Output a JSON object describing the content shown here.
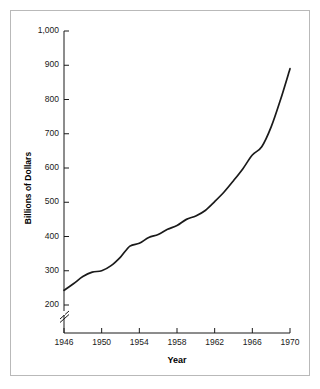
{
  "figure": {
    "background_color": "#ffffff",
    "border_color": "#b9b9b9",
    "line_color": "#1a1a1a"
  },
  "chart_data": {
    "type": "line",
    "title": "",
    "subtitle": "",
    "xlabel": "Year",
    "ylabel": "Billions of Dollars",
    "xlim": [
      1946,
      1970
    ],
    "ylim": [
      200,
      1000
    ],
    "grid": false,
    "legend": "none",
    "y_axis_break": true,
    "y_axis_break_symbol": "//",
    "x_ticks": [
      1946,
      1950,
      1954,
      1958,
      1962,
      1966,
      1970
    ],
    "x_tick_labels": [
      "1946",
      "1950",
      "1954",
      "1958",
      "1962",
      "1966",
      "1970"
    ],
    "y_ticks": [
      200,
      300,
      400,
      500,
      600,
      700,
      800,
      900,
      1000
    ],
    "y_tick_labels": [
      "200",
      "300",
      "400",
      "500",
      "600",
      "700",
      "800",
      "900",
      "1,000"
    ],
    "x": [
      1946,
      1947,
      1948,
      1949,
      1950,
      1951,
      1952,
      1953,
      1954,
      1955,
      1956,
      1957,
      1958,
      1959,
      1960,
      1961,
      1962,
      1963,
      1964,
      1965,
      1966,
      1967,
      1968,
      1969,
      1970
    ],
    "values": [
      243,
      262,
      283,
      296,
      300,
      315,
      340,
      372,
      380,
      397,
      406,
      421,
      432,
      450,
      460,
      476,
      502,
      530,
      563,
      598,
      638,
      662,
      720,
      800,
      890
    ],
    "series": [
      {
        "name": "Billions of Dollars",
        "values": [
          243,
          262,
          283,
          296,
          300,
          315,
          340,
          372,
          380,
          397,
          406,
          421,
          432,
          450,
          460,
          476,
          502,
          530,
          563,
          598,
          638,
          662,
          720,
          800,
          890
        ]
      }
    ],
    "annotations": []
  }
}
